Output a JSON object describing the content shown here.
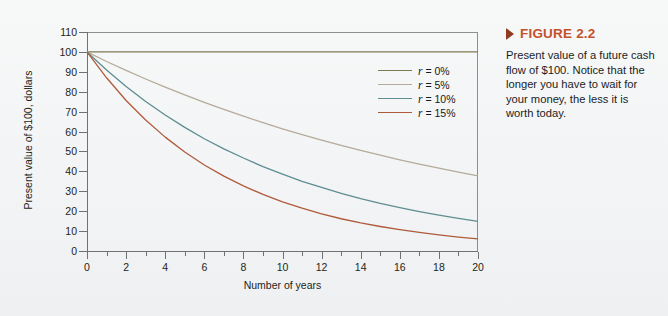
{
  "figure": {
    "marker_icon": "triangle-right-icon",
    "title": "FIGURE 2.2",
    "body": "Present value of a future cash flow of $100. Notice that the longer you have to wait for your money, the less it is worth today.",
    "title_color": "#c3512c",
    "marker_color": "#8e3b22",
    "background_color": "#f4f5f6"
  },
  "chart_data": {
    "type": "line",
    "title": "",
    "xlabel": "Number of years",
    "ylabel": "Present value of $100, dollars",
    "xlim": [
      0,
      20
    ],
    "ylim": [
      0,
      110
    ],
    "grid": false,
    "legend_position": "inside-right",
    "x_major_ticks": [
      0,
      2,
      4,
      6,
      8,
      10,
      12,
      14,
      16,
      18,
      20
    ],
    "x_minor_ticks": [
      1,
      3,
      5,
      7,
      9,
      11,
      13,
      15,
      17,
      19
    ],
    "y_ticks": [
      0,
      10,
      20,
      30,
      40,
      50,
      60,
      70,
      80,
      90,
      100,
      110
    ],
    "x": [
      0,
      1,
      2,
      3,
      4,
      5,
      6,
      7,
      8,
      9,
      10,
      11,
      12,
      13,
      14,
      15,
      16,
      17,
      18,
      19,
      20
    ],
    "series": [
      {
        "name": "r = 0%",
        "rate": 0.0,
        "color": "#7c7a52",
        "values": [
          100,
          100,
          100,
          100,
          100,
          100,
          100,
          100,
          100,
          100,
          100,
          100,
          100,
          100,
          100,
          100,
          100,
          100,
          100,
          100,
          100
        ]
      },
      {
        "name": "r = 5%",
        "rate": 0.05,
        "color": "#b5ab9b",
        "values": [
          100,
          95.2,
          90.7,
          86.4,
          82.3,
          78.4,
          74.6,
          71.1,
          67.7,
          64.5,
          61.4,
          58.5,
          55.7,
          53.0,
          50.5,
          48.1,
          45.8,
          43.6,
          41.6,
          39.6,
          37.7
        ]
      },
      {
        "name": "r = 10%",
        "rate": 0.1,
        "color": "#5e8d92",
        "values": [
          100,
          90.9,
          82.6,
          75.1,
          68.3,
          62.1,
          56.4,
          51.3,
          46.7,
          42.4,
          38.6,
          35.0,
          31.9,
          29.0,
          26.3,
          23.9,
          21.8,
          19.8,
          18.0,
          16.4,
          14.9
        ]
      },
      {
        "name": "r = 15%",
        "rate": 0.15,
        "color": "#b05a3c",
        "values": [
          100,
          87.0,
          75.6,
          65.8,
          57.2,
          49.7,
          43.2,
          37.6,
          32.7,
          28.4,
          24.7,
          21.5,
          18.7,
          16.2,
          14.1,
          12.3,
          10.7,
          9.3,
          8.1,
          7.0,
          6.1
        ]
      }
    ],
    "axis_color": "#6f7274"
  }
}
